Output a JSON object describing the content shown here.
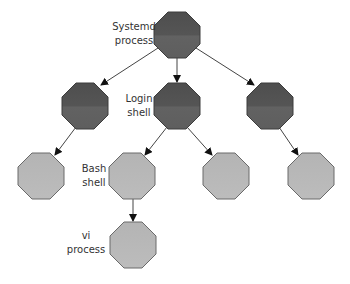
{
  "diagram": {
    "colors": {
      "dark_fill": "#5c5c5c",
      "light_fill": "#b8b8b8",
      "dark_stroke": "#3c3c3c",
      "light_stroke": "#6a6a6a",
      "edge": "#444444"
    },
    "nodes": [
      {
        "id": "systemd",
        "label_line1": "Systemd",
        "label_line2": "process",
        "shade": "dark",
        "cx": 177,
        "cy": 35
      },
      {
        "id": "left-mid",
        "label_line1": "",
        "label_line2": "",
        "shade": "dark",
        "cx": 85,
        "cy": 106
      },
      {
        "id": "login",
        "label_line1": "Login",
        "label_line2": "shell",
        "shade": "dark",
        "cx": 177,
        "cy": 106
      },
      {
        "id": "right-mid",
        "label_line1": "",
        "label_line2": "",
        "shade": "dark",
        "cx": 270,
        "cy": 106
      },
      {
        "id": "left-bottom",
        "label_line1": "",
        "label_line2": "",
        "shade": "light",
        "cx": 41,
        "cy": 176
      },
      {
        "id": "bash",
        "label_line1": "Bash",
        "label_line2": "shell",
        "shade": "light",
        "cx": 132,
        "cy": 176
      },
      {
        "id": "login-child-right",
        "label_line1": "",
        "label_line2": "",
        "shade": "light",
        "cx": 226,
        "cy": 176
      },
      {
        "id": "right-bottom",
        "label_line1": "",
        "label_line2": "",
        "shade": "light",
        "cx": 311,
        "cy": 176
      },
      {
        "id": "vi",
        "label_line1": "vi",
        "label_line2": "process",
        "shade": "light",
        "cx": 133,
        "cy": 245
      }
    ],
    "edges": [
      {
        "from": "systemd",
        "to": "left-mid"
      },
      {
        "from": "systemd",
        "to": "login"
      },
      {
        "from": "systemd",
        "to": "right-mid"
      },
      {
        "from": "left-mid",
        "to": "left-bottom"
      },
      {
        "from": "login",
        "to": "bash"
      },
      {
        "from": "login",
        "to": "login-child-right"
      },
      {
        "from": "right-mid",
        "to": "right-bottom"
      },
      {
        "from": "bash",
        "to": "vi"
      }
    ]
  }
}
